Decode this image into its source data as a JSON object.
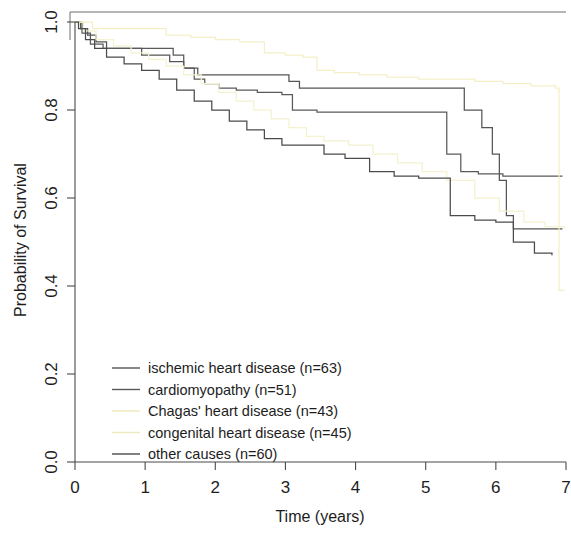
{
  "chart_data": {
    "type": "line",
    "subtype": "kaplan-meier-step",
    "title": "",
    "xlabel": "Time (years)",
    "ylabel": "Probability of Survival",
    "xlim": [
      0,
      7
    ],
    "ylim": [
      0,
      1
    ],
    "xticks": [
      0,
      1,
      2,
      3,
      4,
      5,
      6,
      7
    ],
    "xticklabels": [
      "0",
      "1",
      "2",
      "3",
      "4",
      "5",
      "6",
      "7"
    ],
    "yticks": [
      0.0,
      0.2,
      0.4,
      0.6,
      0.8,
      1.0
    ],
    "yticklabels": [
      "0.0",
      "0.2",
      "0.4",
      "0.6",
      "0.8",
      "1.0"
    ],
    "grid": false,
    "legend_position": "bottom-left-inside",
    "series": [
      {
        "name": "ischemic heart disease (n=63)",
        "label": "ischemic heart disease (n=63)",
        "n": 63,
        "color": "#555555",
        "points": [
          [
            0.0,
            1.0
          ],
          [
            0.08,
            0.985
          ],
          [
            0.18,
            0.97
          ],
          [
            0.3,
            0.955
          ],
          [
            0.45,
            0.94
          ],
          [
            0.7,
            0.94
          ],
          [
            0.95,
            0.925
          ],
          [
            1.15,
            0.925
          ],
          [
            1.35,
            0.91
          ],
          [
            1.55,
            0.895
          ],
          [
            1.75,
            0.88
          ],
          [
            2.0,
            0.88
          ],
          [
            2.3,
            0.88
          ],
          [
            2.6,
            0.88
          ],
          [
            2.95,
            0.88
          ],
          [
            3.05,
            0.865
          ],
          [
            3.2,
            0.85
          ],
          [
            3.6,
            0.85
          ],
          [
            4.0,
            0.85
          ],
          [
            4.6,
            0.85
          ],
          [
            5.1,
            0.85
          ],
          [
            5.45,
            0.85
          ],
          [
            5.55,
            0.8
          ],
          [
            5.8,
            0.76
          ],
          [
            5.95,
            0.7
          ],
          [
            6.05,
            0.64
          ],
          [
            6.15,
            0.56
          ],
          [
            6.25,
            0.53
          ],
          [
            6.6,
            0.53
          ],
          [
            6.95,
            0.53
          ]
        ]
      },
      {
        "name": "cardiomyopathy (n=51)",
        "label": "cardiomyopathy (n=51)",
        "n": 51,
        "color": "#5a5a5a",
        "points": [
          [
            0.0,
            1.0
          ],
          [
            0.1,
            0.975
          ],
          [
            0.22,
            0.95
          ],
          [
            0.4,
            0.94
          ],
          [
            0.6,
            0.94
          ],
          [
            0.9,
            0.94
          ],
          [
            1.15,
            0.94
          ],
          [
            1.4,
            0.925
          ],
          [
            1.55,
            0.895
          ],
          [
            1.7,
            0.87
          ],
          [
            1.85,
            0.86
          ],
          [
            2.05,
            0.85
          ],
          [
            2.3,
            0.845
          ],
          [
            2.6,
            0.84
          ],
          [
            2.95,
            0.835
          ],
          [
            3.1,
            0.8
          ],
          [
            3.45,
            0.795
          ],
          [
            3.9,
            0.795
          ],
          [
            4.4,
            0.795
          ],
          [
            4.9,
            0.795
          ],
          [
            5.2,
            0.795
          ],
          [
            5.3,
            0.7
          ],
          [
            5.5,
            0.66
          ],
          [
            5.75,
            0.655
          ],
          [
            6.1,
            0.65
          ],
          [
            6.5,
            0.65
          ],
          [
            6.7,
            0.65
          ],
          [
            6.95,
            0.65
          ]
        ]
      },
      {
        "name": "Chagas' heart disease (n=43)",
        "label": "Chagas' heart disease (n=43)",
        "n": 43,
        "color": "#f5efc8",
        "points": [
          [
            0.0,
            1.0
          ],
          [
            0.25,
            0.985
          ],
          [
            0.6,
            0.985
          ],
          [
            1.0,
            0.985
          ],
          [
            1.3,
            0.97
          ],
          [
            1.65,
            0.965
          ],
          [
            2.0,
            0.96
          ],
          [
            2.35,
            0.955
          ],
          [
            2.7,
            0.93
          ],
          [
            3.0,
            0.925
          ],
          [
            3.25,
            0.92
          ],
          [
            3.45,
            0.89
          ],
          [
            3.7,
            0.885
          ],
          [
            4.05,
            0.88
          ],
          [
            4.45,
            0.875
          ],
          [
            4.9,
            0.87
          ],
          [
            5.3,
            0.87
          ],
          [
            5.7,
            0.865
          ],
          [
            6.1,
            0.86
          ],
          [
            6.5,
            0.855
          ],
          [
            6.85,
            0.85
          ],
          [
            6.9,
            0.39
          ],
          [
            6.98,
            0.39
          ]
        ]
      },
      {
        "name": "congenital heart disease (n=45)",
        "label": "congenital heart disease (n=45)",
        "n": 45,
        "color": "#f4f2d0",
        "points": [
          [
            0.0,
            1.0
          ],
          [
            0.12,
            0.98
          ],
          [
            0.3,
            0.96
          ],
          [
            0.55,
            0.945
          ],
          [
            0.8,
            0.93
          ],
          [
            1.05,
            0.915
          ],
          [
            1.3,
            0.9
          ],
          [
            1.55,
            0.88
          ],
          [
            1.8,
            0.86
          ],
          [
            2.05,
            0.84
          ],
          [
            2.3,
            0.82
          ],
          [
            2.55,
            0.8
          ],
          [
            2.8,
            0.78
          ],
          [
            3.05,
            0.76
          ],
          [
            3.3,
            0.74
          ],
          [
            3.55,
            0.73
          ],
          [
            3.9,
            0.72
          ],
          [
            4.25,
            0.7
          ],
          [
            4.6,
            0.68
          ],
          [
            4.95,
            0.66
          ],
          [
            5.3,
            0.64
          ],
          [
            5.7,
            0.6
          ],
          [
            6.05,
            0.57
          ],
          [
            6.4,
            0.545
          ],
          [
            6.7,
            0.535
          ],
          [
            6.98,
            0.53
          ]
        ]
      },
      {
        "name": "other causes (n=60)",
        "label": "other causes (n=60)",
        "n": 60,
        "color": "#4b4b4b",
        "points": [
          [
            0.0,
            1.0
          ],
          [
            0.05,
            0.985
          ],
          [
            0.15,
            0.96
          ],
          [
            0.28,
            0.94
          ],
          [
            0.45,
            0.92
          ],
          [
            0.7,
            0.905
          ],
          [
            0.95,
            0.89
          ],
          [
            1.2,
            0.87
          ],
          [
            1.45,
            0.845
          ],
          [
            1.7,
            0.82
          ],
          [
            1.95,
            0.8
          ],
          [
            2.2,
            0.775
          ],
          [
            2.45,
            0.755
          ],
          [
            2.7,
            0.735
          ],
          [
            2.95,
            0.72
          ],
          [
            3.25,
            0.72
          ],
          [
            3.55,
            0.7
          ],
          [
            3.85,
            0.69
          ],
          [
            4.2,
            0.66
          ],
          [
            4.55,
            0.65
          ],
          [
            4.9,
            0.645
          ],
          [
            5.2,
            0.645
          ],
          [
            5.35,
            0.56
          ],
          [
            5.7,
            0.55
          ],
          [
            6.0,
            0.545
          ],
          [
            6.25,
            0.5
          ],
          [
            6.55,
            0.475
          ],
          [
            6.8,
            0.47
          ]
        ]
      }
    ]
  },
  "axes": {
    "x_title": "Time (years)",
    "y_title": "Probability of Survival"
  },
  "legend": {
    "entries": [
      {
        "label": "ischemic heart disease (n=63)",
        "color": "#555555"
      },
      {
        "label": "cardiomyopathy (n=51)",
        "color": "#5a5a5a"
      },
      {
        "label": "Chagas' heart disease (n=43)",
        "color": "#efe9b8"
      },
      {
        "label": "congenital heart disease (n=45)",
        "color": "#eeeabf"
      },
      {
        "label": "other causes (n=60)",
        "color": "#4b4b4b"
      }
    ]
  },
  "colors": {
    "axis": "#4a4a4a",
    "text": "#1d1d1d",
    "background": "#ffffff"
  }
}
